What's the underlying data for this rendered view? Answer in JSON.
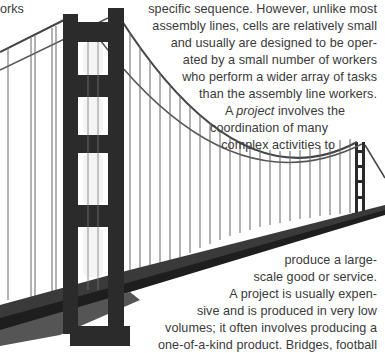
{
  "page": {
    "left_fragment": "orks",
    "paragraph_cells": [
      "specific sequence. However, unlike most",
      "assembly lines, cells are relatively small",
      "and usually are designed to be oper-",
      "ated by a small number of workers",
      "who perform a wider array of tasks",
      "than the assembly line workers."
    ],
    "project_intro": {
      "prefix": "A ",
      "term": "project",
      "suffix": " involves the"
    },
    "paragraph_project_top": [
      "coordination of many",
      "complex activities to"
    ],
    "paragraph_project_bottom": [
      "produce a large-",
      "scale good or service.",
      "A project is usually expen-",
      "sive and is produced in very low",
      "volumes; it often involves producing a",
      "one-of-a-kind product. Bridges, football"
    ]
  },
  "image": {
    "icon": "suspension-bridge-photo",
    "subject": "Golden Gate Bridge"
  }
}
